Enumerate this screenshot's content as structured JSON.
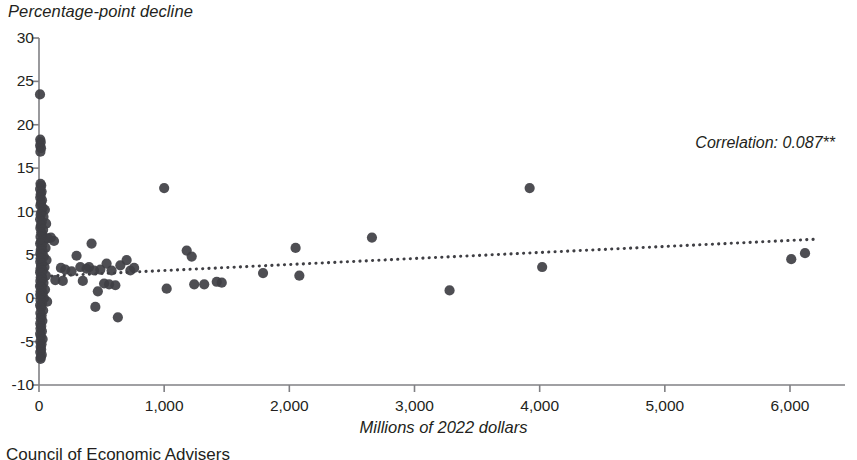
{
  "figure": {
    "footer_note": "Council of Economic Advisers",
    "annotation": "Correlation: 0.087**",
    "marker_color": "#3f3f44",
    "axis_color": "#808084",
    "trendline_color": "#3f3f44"
  },
  "chart_data": {
    "type": "scatter",
    "title": "",
    "subtitle": "",
    "xlabel": "Millions of 2022 dollars",
    "ylabel": "Percentage-point decline",
    "xlim": [
      0,
      6500
    ],
    "ylim": [
      -10,
      30
    ],
    "xticks": [
      0,
      1000,
      2000,
      3000,
      4000,
      5000,
      6000
    ],
    "xtick_labels": [
      "0",
      "1,000",
      "2,000",
      "3,000",
      "4,000",
      "5,000",
      "6,000"
    ],
    "yticks": [
      -10,
      -5,
      0,
      5,
      10,
      15,
      20,
      25,
      30
    ],
    "ytick_labels": [
      "-10",
      "-5",
      "0",
      "5",
      "10",
      "15",
      "20",
      "25",
      "30"
    ],
    "grid": false,
    "legend": null,
    "annotations": [
      {
        "text": "Correlation: 0.087**",
        "x": 4700,
        "y": 16.2
      }
    ],
    "trendline": {
      "type": "linear",
      "x": [
        0,
        6200
      ],
      "y": [
        2.5,
        6.8
      ],
      "style": "dotted"
    },
    "series": [
      {
        "name": "Programs",
        "color": "#3f3f44",
        "points": [
          [
            8,
            23.5
          ],
          [
            10,
            18.3
          ],
          [
            14,
            18.0
          ],
          [
            9,
            17.6
          ],
          [
            16,
            17.3
          ],
          [
            11,
            16.9
          ],
          [
            12,
            13.2
          ],
          [
            18,
            13.0
          ],
          [
            9,
            12.6
          ],
          [
            21,
            12.3
          ],
          [
            14,
            12.0
          ],
          [
            10,
            11.6
          ],
          [
            24,
            11.3
          ],
          [
            16,
            11.0
          ],
          [
            11,
            10.7
          ],
          [
            30,
            10.4
          ],
          [
            47,
            10.2
          ],
          [
            19,
            9.9
          ],
          [
            13,
            9.6
          ],
          [
            36,
            9.4
          ],
          [
            9,
            9.1
          ],
          [
            22,
            8.8
          ],
          [
            57,
            8.6
          ],
          [
            15,
            8.4
          ],
          [
            11,
            8.1
          ],
          [
            33,
            7.9
          ],
          [
            18,
            7.6
          ],
          [
            26,
            7.4
          ],
          [
            12,
            7.1
          ],
          [
            70,
            6.9
          ],
          [
            41,
            6.7
          ],
          [
            16,
            6.5
          ],
          [
            9,
            6.3
          ],
          [
            23,
            6.0
          ],
          [
            52,
            5.8
          ],
          [
            14,
            5.6
          ],
          [
            29,
            5.4
          ],
          [
            11,
            5.2
          ],
          [
            18,
            5.0
          ],
          [
            38,
            4.8
          ],
          [
            13,
            4.6
          ],
          [
            60,
            4.4
          ],
          [
            10,
            4.2
          ],
          [
            25,
            4.0
          ],
          [
            17,
            3.8
          ],
          [
            44,
            3.6
          ],
          [
            12,
            3.4
          ],
          [
            31,
            3.2
          ],
          [
            9,
            3.0
          ],
          [
            20,
            2.8
          ],
          [
            55,
            2.6
          ],
          [
            14,
            2.4
          ],
          [
            27,
            2.2
          ],
          [
            11,
            2.0
          ],
          [
            36,
            1.8
          ],
          [
            16,
            1.6
          ],
          [
            8,
            1.4
          ],
          [
            22,
            1.2
          ],
          [
            48,
            1.0
          ],
          [
            13,
            0.8
          ],
          [
            30,
            0.6
          ],
          [
            10,
            0.4
          ],
          [
            19,
            0.2
          ],
          [
            40,
            0.0
          ],
          [
            12,
            -0.2
          ],
          [
            65,
            -0.4
          ],
          [
            24,
            -0.6
          ],
          [
            9,
            -0.8
          ],
          [
            16,
            -1.1
          ],
          [
            33,
            -1.4
          ],
          [
            11,
            -1.7
          ],
          [
            21,
            -2.0
          ],
          [
            14,
            -2.3
          ],
          [
            27,
            -2.6
          ],
          [
            10,
            -2.9
          ],
          [
            18,
            -3.2
          ],
          [
            12,
            -3.5
          ],
          [
            23,
            -3.8
          ],
          [
            9,
            -4.1
          ],
          [
            15,
            -4.4
          ],
          [
            29,
            -4.7
          ],
          [
            11,
            -5.0
          ],
          [
            20,
            -5.3
          ],
          [
            13,
            -5.6
          ],
          [
            17,
            -5.9
          ],
          [
            10,
            -6.2
          ],
          [
            22,
            -6.5
          ],
          [
            14,
            -6.8
          ],
          [
            12,
            -7.0
          ],
          [
            95,
            7.0
          ],
          [
            120,
            6.6
          ],
          [
            130,
            2.1
          ],
          [
            175,
            3.5
          ],
          [
            190,
            2.0
          ],
          [
            210,
            3.3
          ],
          [
            260,
            3.1
          ],
          [
            300,
            4.9
          ],
          [
            330,
            3.6
          ],
          [
            350,
            2.0
          ],
          [
            380,
            3.4
          ],
          [
            400,
            3.6
          ],
          [
            420,
            6.3
          ],
          [
            440,
            3.2
          ],
          [
            450,
            -1.0
          ],
          [
            470,
            0.8
          ],
          [
            490,
            3.3
          ],
          [
            520,
            1.7
          ],
          [
            540,
            4.0
          ],
          [
            560,
            1.6
          ],
          [
            580,
            3.2
          ],
          [
            610,
            1.5
          ],
          [
            630,
            -2.2
          ],
          [
            650,
            3.8
          ],
          [
            700,
            4.4
          ],
          [
            730,
            3.2
          ],
          [
            760,
            3.5
          ],
          [
            1000,
            12.7
          ],
          [
            1020,
            1.1
          ],
          [
            1180,
            5.5
          ],
          [
            1220,
            4.8
          ],
          [
            1240,
            1.6
          ],
          [
            1320,
            1.6
          ],
          [
            1420,
            1.9
          ],
          [
            1460,
            1.8
          ],
          [
            1790,
            2.9
          ],
          [
            2050,
            5.8
          ],
          [
            2080,
            2.6
          ],
          [
            2660,
            7.0
          ],
          [
            3280,
            0.9
          ],
          [
            3920,
            12.7
          ],
          [
            4020,
            3.6
          ],
          [
            6010,
            4.5
          ],
          [
            6120,
            5.2
          ]
        ]
      }
    ]
  }
}
